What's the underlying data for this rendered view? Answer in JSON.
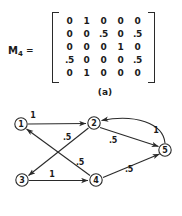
{
  "figure": {
    "panel_a": {
      "label": "M",
      "label_subscript": "4",
      "equals": "=",
      "caption": "(a)",
      "matrix": [
        [
          "0",
          "1",
          "0",
          "0",
          "0"
        ],
        [
          "0",
          "0",
          ".5",
          "0",
          ".5"
        ],
        [
          "0",
          "0",
          "0",
          "1",
          "0"
        ],
        [
          ".5",
          "0",
          "0",
          "0",
          ".5"
        ],
        [
          "0",
          "1",
          "0",
          "0",
          "0"
        ]
      ]
    },
    "panel_b": {
      "caption": "(b)",
      "nodes": [
        {
          "id": "1",
          "label": "1",
          "x": 21,
          "y": 20
        },
        {
          "id": "2",
          "label": "2",
          "x": 94,
          "y": 19
        },
        {
          "id": "3",
          "label": "3",
          "x": 22,
          "y": 76
        },
        {
          "id": "4",
          "label": "4",
          "x": 96,
          "y": 76
        },
        {
          "id": "5",
          "label": "5",
          "x": 165,
          "y": 46
        }
      ],
      "edges": [
        {
          "from": "1",
          "to": "2",
          "label": "1",
          "label_x": 33,
          "label_y": 11
        },
        {
          "from": "2",
          "to": "3",
          "label": ".5",
          "label_x": 67,
          "label_y": 33
        },
        {
          "from": "2",
          "to": "5",
          "label": ".5",
          "label_x": 113,
          "label_y": 36
        },
        {
          "from": "3",
          "to": "4",
          "label": "1",
          "label_x": 52,
          "label_y": 70
        },
        {
          "from": "4",
          "to": "1",
          "label": ".5",
          "label_x": 80,
          "label_y": 58
        },
        {
          "from": "4",
          "to": "5",
          "label": ".5",
          "label_x": 129,
          "label_y": 65
        },
        {
          "from": "5",
          "to": "2",
          "label": "1",
          "label_x": 156,
          "label_y": 26
        }
      ]
    }
  },
  "chart_data": {
    "type": "diagram",
    "matrix_name": "M_4",
    "matrix_size": [
      5,
      5
    ],
    "row_labels": [
      "1",
      "2",
      "3",
      "4",
      "5"
    ],
    "column_labels": [
      "1",
      "2",
      "3",
      "4",
      "5"
    ],
    "matrix_values": [
      [
        0,
        1,
        0,
        0,
        0
      ],
      [
        0,
        0,
        0.5,
        0,
        0.5
      ],
      [
        0,
        0,
        0,
        1,
        0
      ],
      [
        0.5,
        0,
        0,
        0,
        0.5
      ],
      [
        0,
        1,
        0,
        0,
        0
      ]
    ],
    "graph_edges": [
      {
        "source": 1,
        "target": 2,
        "weight": 1
      },
      {
        "source": 2,
        "target": 3,
        "weight": 0.5
      },
      {
        "source": 2,
        "target": 5,
        "weight": 0.5
      },
      {
        "source": 3,
        "target": 4,
        "weight": 1
      },
      {
        "source": 4,
        "target": 1,
        "weight": 0.5
      },
      {
        "source": 4,
        "target": 5,
        "weight": 0.5
      },
      {
        "source": 5,
        "target": 2,
        "weight": 1
      }
    ],
    "captions": [
      "(a)",
      "(b)"
    ]
  }
}
